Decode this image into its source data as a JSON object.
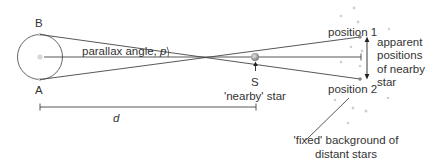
{
  "diagram": {
    "labels": {
      "point_b": "B",
      "point_a": "A",
      "parallax_angle": "parallax angle, ",
      "parallax_symbol": "p",
      "star_letter": "S",
      "nearby_star": "'nearby' star",
      "distance": "d",
      "position_1": "position 1",
      "position_2": "position 2",
      "apparent_line1": "apparent",
      "apparent_line2": "positions",
      "apparent_line3": "of nearby",
      "apparent_line4": "star",
      "fixed_line1": "'fixed' background of",
      "fixed_line2": "distant stars"
    },
    "colors": {
      "line": "#444444",
      "text": "#333333",
      "star": "#9a9a9a",
      "background_star": "#c8c8c8"
    },
    "nodes": [
      {
        "id": "earth-orbit",
        "type": "circle"
      },
      {
        "id": "B",
        "type": "point"
      },
      {
        "id": "A",
        "type": "point"
      },
      {
        "id": "S",
        "type": "star"
      },
      {
        "id": "position-1",
        "type": "point"
      },
      {
        "id": "position-2",
        "type": "point"
      }
    ],
    "edges": [
      {
        "from": "B",
        "to": "position-2",
        "via": "S"
      },
      {
        "from": "A",
        "to": "position-1",
        "via": "S"
      },
      {
        "from": "sun",
        "to": "background",
        "via": "S"
      }
    ]
  }
}
